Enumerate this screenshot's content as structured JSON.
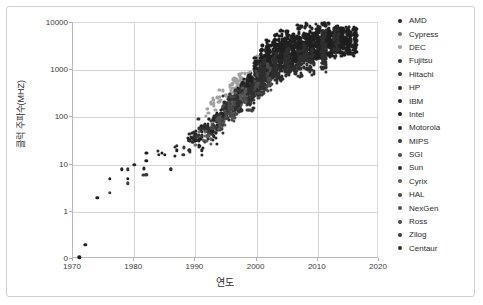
{
  "chart_data": {
    "type": "scatter",
    "title": "",
    "xlabel": "연도",
    "ylabel": "클럭 주파수(MHZ)",
    "yscale": "log",
    "xlim": [
      1970,
      2020
    ],
    "ylim": [
      0,
      10000
    ],
    "grid": true,
    "legend_position": "right",
    "xticks": [
      "1970",
      "1980",
      "1990",
      "2000",
      "2010",
      "2020"
    ],
    "xtick_values": [
      1970,
      1980,
      1990,
      2000,
      2010,
      2020
    ],
    "yticks": [
      "0",
      "1",
      "10",
      "100",
      "1000",
      "10000"
    ],
    "ytick_values": [
      0,
      1,
      10,
      100,
      1000,
      10000
    ],
    "marker_color": "#262626",
    "series": [
      {
        "name": "AMD",
        "color": "#262626",
        "points": [
          [
            1991,
            20
          ],
          [
            1993,
            40
          ],
          [
            1994,
            75
          ],
          [
            1995,
            100
          ],
          [
            1996,
            166
          ],
          [
            1997,
            233
          ],
          [
            1998,
            350
          ],
          [
            1999,
            600
          ],
          [
            2000,
            1000
          ],
          [
            2001,
            1400
          ],
          [
            2002,
            1733
          ],
          [
            2003,
            2200
          ],
          [
            2004,
            2400
          ],
          [
            2005,
            2600
          ],
          [
            2006,
            2800
          ],
          [
            2007,
            2600
          ],
          [
            2008,
            3000
          ],
          [
            2009,
            3200
          ],
          [
            2010,
            3300
          ],
          [
            2011,
            3600
          ],
          [
            2012,
            4000
          ],
          [
            2013,
            4200
          ],
          [
            2014,
            4000
          ],
          [
            2015,
            3900
          ],
          [
            2016,
            3800
          ]
        ]
      },
      {
        "name": "Cypress",
        "color": "#6e6e6e",
        "points": [
          [
            1990,
            33
          ],
          [
            1991,
            40
          ],
          [
            1992,
            50
          ],
          [
            1993,
            66
          ],
          [
            1994,
            80
          ]
        ]
      },
      {
        "name": "DEC",
        "color": "#a0a0a0",
        "points": [
          [
            1992,
            150
          ],
          [
            1993,
            200
          ],
          [
            1994,
            275
          ],
          [
            1995,
            300
          ],
          [
            1996,
            500
          ],
          [
            1997,
            600
          ],
          [
            1998,
            600
          ],
          [
            1999,
            700
          ],
          [
            2000,
            1000
          ]
        ]
      },
      {
        "name": "Fujitsu",
        "color": "#333333",
        "points": [
          [
            1995,
            170
          ],
          [
            1997,
            250
          ],
          [
            1999,
            300
          ],
          [
            2001,
            675
          ],
          [
            2003,
            1350
          ],
          [
            2005,
            1800
          ],
          [
            2007,
            2400
          ],
          [
            2009,
            2000
          ],
          [
            2011,
            1650
          ],
          [
            2013,
            3700
          ]
        ]
      },
      {
        "name": "Hitachi",
        "color": "#3d3d3d",
        "points": [
          [
            1993,
            66
          ],
          [
            1995,
            120
          ],
          [
            1997,
            200
          ],
          [
            1999,
            400
          ],
          [
            2001,
            600
          ]
        ]
      },
      {
        "name": "HP",
        "color": "#2e2e2e",
        "points": [
          [
            1986,
            8
          ],
          [
            1989,
            33
          ],
          [
            1991,
            66
          ],
          [
            1993,
            99
          ],
          [
            1995,
            120
          ],
          [
            1996,
            180
          ],
          [
            1997,
            240
          ],
          [
            1998,
            440
          ],
          [
            1999,
            550
          ],
          [
            2000,
            750
          ],
          [
            2002,
            875
          ],
          [
            2004,
            1100
          ],
          [
            2006,
            1600
          ]
        ]
      },
      {
        "name": "IBM",
        "color": "#242424",
        "points": [
          [
            1990,
            41
          ],
          [
            1992,
            62
          ],
          [
            1993,
            66
          ],
          [
            1994,
            100
          ],
          [
            1995,
            133
          ],
          [
            1996,
            200
          ],
          [
            1997,
            262
          ],
          [
            1998,
            400
          ],
          [
            1999,
            450
          ],
          [
            2000,
            600
          ],
          [
            2001,
            1100
          ],
          [
            2002,
            1300
          ],
          [
            2003,
            1700
          ],
          [
            2004,
            1900
          ],
          [
            2005,
            2200
          ],
          [
            2006,
            2500
          ],
          [
            2007,
            4700
          ],
          [
            2008,
            5000
          ],
          [
            2009,
            4400
          ],
          [
            2010,
            5200
          ],
          [
            2011,
            5500
          ],
          [
            2012,
            5500
          ],
          [
            2013,
            4400
          ],
          [
            2014,
            4400
          ],
          [
            2015,
            4300
          ]
        ]
      },
      {
        "name": "Intel",
        "color": "#1f1f1f",
        "points": [
          [
            1971,
            0.108
          ],
          [
            1972,
            0.2
          ],
          [
            1974,
            2
          ],
          [
            1976,
            5
          ],
          [
            1978,
            8
          ],
          [
            1979,
            5
          ],
          [
            1982,
            6
          ],
          [
            1982,
            12
          ],
          [
            1985,
            16
          ],
          [
            1987,
            20
          ],
          [
            1989,
            33
          ],
          [
            1990,
            33
          ],
          [
            1991,
            50
          ],
          [
            1992,
            66
          ],
          [
            1993,
            60
          ],
          [
            1994,
            100
          ],
          [
            1995,
            133
          ],
          [
            1996,
            200
          ],
          [
            1997,
            300
          ],
          [
            1998,
            450
          ],
          [
            1999,
            600
          ],
          [
            2000,
            1000
          ],
          [
            2001,
            1700
          ],
          [
            2002,
            2200
          ],
          [
            2003,
            3060
          ],
          [
            2004,
            3600
          ],
          [
            2005,
            3800
          ],
          [
            2006,
            3000
          ],
          [
            2007,
            3000
          ],
          [
            2008,
            3200
          ],
          [
            2009,
            3330
          ],
          [
            2010,
            3460
          ],
          [
            2011,
            3500
          ],
          [
            2012,
            3600
          ],
          [
            2013,
            3900
          ],
          [
            2014,
            4000
          ],
          [
            2015,
            4000
          ],
          [
            2016,
            4200
          ]
        ]
      },
      {
        "name": "Motorola",
        "color": "#2b2b2b",
        "points": [
          [
            1979,
            8
          ],
          [
            1980,
            10
          ],
          [
            1984,
            16
          ],
          [
            1987,
            25
          ],
          [
            1989,
            33
          ],
          [
            1990,
            40
          ],
          [
            1992,
            50
          ],
          [
            1994,
            75
          ],
          [
            1996,
            200
          ],
          [
            1998,
            366
          ],
          [
            2000,
            500
          ]
        ]
      },
      {
        "name": "MIPS",
        "color": "#353535",
        "points": [
          [
            1988,
            16
          ],
          [
            1991,
            40
          ],
          [
            1992,
            50
          ],
          [
            1994,
            100
          ],
          [
            1995,
            200
          ],
          [
            1996,
            250
          ],
          [
            1997,
            267
          ],
          [
            1999,
            400
          ]
        ]
      },
      {
        "name": "SGI",
        "color": "#4a4a4a",
        "points": [
          [
            1994,
            75
          ],
          [
            1996,
            195
          ],
          [
            1998,
            250
          ],
          [
            2000,
            500
          ],
          [
            2002,
            700
          ]
        ]
      },
      {
        "name": "Sun",
        "color": "#303030",
        "points": [
          [
            1989,
            20
          ],
          [
            1992,
            40
          ],
          [
            1994,
            60
          ],
          [
            1995,
            143
          ],
          [
            1996,
            167
          ],
          [
            1997,
            250
          ],
          [
            1999,
            360
          ],
          [
            2001,
            900
          ],
          [
            2003,
            1200
          ],
          [
            2005,
            1500
          ],
          [
            2007,
            1400
          ],
          [
            2009,
            1600
          ],
          [
            2011,
            3600
          ],
          [
            2013,
            3600
          ]
        ]
      },
      {
        "name": "Cyrix",
        "color": "#5a5a5a",
        "points": [
          [
            1992,
            40
          ],
          [
            1994,
            66
          ],
          [
            1996,
            150
          ],
          [
            1997,
            233
          ],
          [
            1998,
            300
          ]
        ]
      },
      {
        "name": "HAL",
        "color": "#444444",
        "points": [
          [
            1995,
            118
          ],
          [
            1997,
            154
          ],
          [
            1999,
            200
          ]
        ]
      },
      {
        "name": "NexGen",
        "color": "#505050",
        "points": [
          [
            1994,
            75
          ],
          [
            1995,
            93
          ],
          [
            1996,
            111
          ]
        ]
      },
      {
        "name": "Ross",
        "color": "#484848",
        "points": [
          [
            1993,
            60
          ],
          [
            1995,
            125
          ],
          [
            1996,
            150
          ]
        ]
      },
      {
        "name": "Zilog",
        "color": "#3a3a3a",
        "points": [
          [
            1976,
            2.5
          ],
          [
            1979,
            4
          ],
          [
            1982,
            6
          ]
        ]
      },
      {
        "name": "Centaur",
        "color": "#2f2f2f",
        "points": [
          [
            1997,
            180
          ],
          [
            1999,
            233
          ],
          [
            2001,
            800
          ],
          [
            2003,
            1000
          ],
          [
            2005,
            1500
          ],
          [
            2008,
            1800
          ],
          [
            2011,
            2000
          ]
        ]
      }
    ]
  },
  "legend": {
    "items": [
      {
        "label": "AMD"
      },
      {
        "label": "Cypress"
      },
      {
        "label": "DEC"
      },
      {
        "label": "Fujitsu"
      },
      {
        "label": "Hitachi"
      },
      {
        "label": "HP"
      },
      {
        "label": "IBM"
      },
      {
        "label": "Intel"
      },
      {
        "label": "Motorola"
      },
      {
        "label": "MIPS"
      },
      {
        "label": "SGI"
      },
      {
        "label": "Sun"
      },
      {
        "label": "Cyrix"
      },
      {
        "label": "HAL"
      },
      {
        "label": "NexGen"
      },
      {
        "label": "Ross"
      },
      {
        "label": "Zilog"
      },
      {
        "label": "Centaur"
      }
    ]
  }
}
